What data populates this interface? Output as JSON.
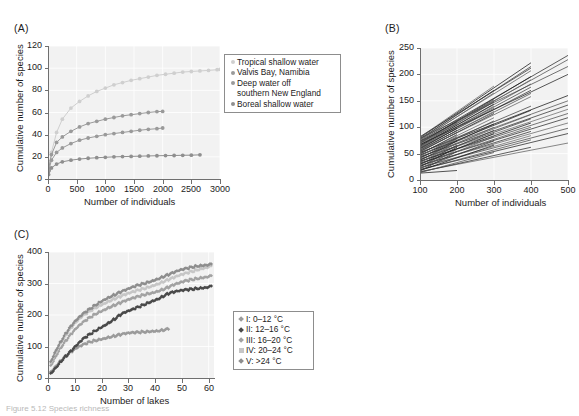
{
  "figure": {
    "caption_fragment": "Figure 5.12  Species richness",
    "panels": [
      "(A)",
      "(B)",
      "(C)"
    ]
  },
  "chart_data": [
    {
      "panel": "(A)",
      "type": "line",
      "title": "",
      "xlabel": "Number of individuals",
      "ylabel": "Cumulative number of species",
      "xlim": [
        0,
        3000
      ],
      "ylim": [
        0,
        120
      ],
      "xticks": [
        0,
        500,
        1000,
        1500,
        2000,
        2500,
        3000
      ],
      "yticks": [
        0,
        20,
        40,
        60,
        80,
        100,
        120
      ],
      "grid": true,
      "legend_position": "right",
      "marker": "circle",
      "series": [
        {
          "name": "Tropical shallow water",
          "color": "#cfcfcf",
          "x": [
            10,
            60,
            150,
            250,
            400,
            550,
            700,
            850,
            1000,
            1150,
            1300,
            1450,
            1600,
            1750,
            1900,
            2050,
            2200,
            2350,
            2500,
            2650,
            2800,
            2950,
            3000
          ],
          "y": [
            8,
            24,
            42,
            54,
            64,
            70,
            75,
            79,
            82,
            85,
            87,
            89,
            90.5,
            92,
            93.5,
            94.5,
            95.5,
            96.5,
            97,
            97.5,
            98,
            98.6,
            99
          ]
        },
        {
          "name": "Valvis Bay, Namibia",
          "color": "#9a9a9a",
          "x": [
            10,
            60,
            150,
            250,
            400,
            550,
            700,
            850,
            1000,
            1150,
            1300,
            1450,
            1600,
            1750,
            1900,
            2000
          ],
          "y": [
            9,
            22,
            33,
            38,
            43,
            47,
            50,
            52,
            54,
            55.5,
            57,
            58,
            59,
            60,
            60.8,
            61
          ]
        },
        {
          "name": "Deep water off southern New England",
          "color": "#9a9a9a",
          "x": [
            10,
            60,
            150,
            250,
            400,
            550,
            700,
            850,
            1000,
            1150,
            1300,
            1450,
            1600,
            1750,
            1900,
            2000
          ],
          "y": [
            7,
            17,
            24,
            28,
            32,
            35,
            37,
            38.5,
            40,
            41,
            42,
            43,
            44,
            44.8,
            45.4,
            46
          ]
        },
        {
          "name": "Boreal shallow water",
          "color": "#8f8f8f",
          "x": [
            10,
            60,
            150,
            250,
            400,
            550,
            700,
            850,
            1000,
            1150,
            1300,
            1450,
            1600,
            1750,
            1900,
            2050,
            2200,
            2350,
            2500,
            2650
          ],
          "y": [
            4,
            10,
            13.5,
            15.5,
            17,
            18,
            18.7,
            19.2,
            19.6,
            20,
            20.2,
            20.4,
            20.6,
            20.8,
            21,
            21.1,
            21.2,
            21.4,
            21.5,
            21.8
          ]
        }
      ],
      "legend": [
        {
          "label": "Tropical shallow water",
          "marker": "circle",
          "color": "#cfcfcf"
        },
        {
          "label": "Valvis Bay, Namibia",
          "marker": "circle",
          "color": "#9a9a9a"
        },
        {
          "label": "Deep water off",
          "label2": "southern New England",
          "marker": "circle",
          "color": "#9a9a9a"
        },
        {
          "label": "Boreal shallow water",
          "marker": "circle",
          "color": "#8f8f8f"
        }
      ]
    },
    {
      "panel": "(B)",
      "type": "line",
      "title": "",
      "xlabel": "Number of individuals",
      "ylabel": "Cumulative number of species",
      "xlim": [
        100,
        500
      ],
      "ylim": [
        0,
        250
      ],
      "xticks": [
        100,
        200,
        300,
        400,
        500
      ],
      "yticks": [
        0,
        50,
        100,
        150,
        200,
        250
      ],
      "grid": true,
      "legend_position": "none",
      "description": "Rarefaction lines fanning from x=100, each terminating at 200, 300, 400 or 500 individuals",
      "lines": [
        {
          "x0": 100,
          "y0": 80,
          "x1": 400,
          "y1": 222
        },
        {
          "x0": 100,
          "y0": 78,
          "x1": 400,
          "y1": 215
        },
        {
          "x0": 100,
          "y0": 76,
          "x1": 400,
          "y1": 207
        },
        {
          "x0": 100,
          "y0": 74,
          "x1": 500,
          "y1": 236
        },
        {
          "x0": 100,
          "y0": 72,
          "x1": 500,
          "y1": 228
        },
        {
          "x0": 100,
          "y0": 70,
          "x1": 400,
          "y1": 196
        },
        {
          "x0": 100,
          "y0": 69,
          "x1": 300,
          "y1": 152
        },
        {
          "x0": 100,
          "y0": 68,
          "x1": 400,
          "y1": 190
        },
        {
          "x0": 100,
          "y0": 66,
          "x1": 300,
          "y1": 148
        },
        {
          "x0": 100,
          "y0": 65,
          "x1": 400,
          "y1": 182
        },
        {
          "x0": 100,
          "y0": 64,
          "x1": 300,
          "y1": 144
        },
        {
          "x0": 100,
          "y0": 63,
          "x1": 400,
          "y1": 176
        },
        {
          "x0": 100,
          "y0": 62,
          "x1": 300,
          "y1": 140
        },
        {
          "x0": 100,
          "y0": 61,
          "x1": 400,
          "y1": 170
        },
        {
          "x0": 100,
          "y0": 60,
          "x1": 300,
          "y1": 136
        },
        {
          "x0": 100,
          "y0": 59,
          "x1": 200,
          "y1": 98
        },
        {
          "x0": 100,
          "y0": 58,
          "x1": 400,
          "y1": 164
        },
        {
          "x0": 100,
          "y0": 57,
          "x1": 300,
          "y1": 130
        },
        {
          "x0": 100,
          "y0": 56,
          "x1": 200,
          "y1": 94
        },
        {
          "x0": 100,
          "y0": 55,
          "x1": 400,
          "y1": 158
        },
        {
          "x0": 100,
          "y0": 54,
          "x1": 300,
          "y1": 126
        },
        {
          "x0": 100,
          "y0": 53,
          "x1": 200,
          "y1": 90
        },
        {
          "x0": 100,
          "y0": 52,
          "x1": 500,
          "y1": 160
        },
        {
          "x0": 100,
          "y0": 51,
          "x1": 400,
          "y1": 140
        },
        {
          "x0": 100,
          "y0": 50,
          "x1": 300,
          "y1": 118
        },
        {
          "x0": 100,
          "y0": 49,
          "x1": 200,
          "y1": 86
        },
        {
          "x0": 100,
          "y0": 48,
          "x1": 500,
          "y1": 150
        },
        {
          "x0": 100,
          "y0": 47,
          "x1": 400,
          "y1": 132
        },
        {
          "x0": 100,
          "y0": 46,
          "x1": 300,
          "y1": 112
        },
        {
          "x0": 100,
          "y0": 45,
          "x1": 200,
          "y1": 82
        },
        {
          "x0": 100,
          "y0": 44,
          "x1": 500,
          "y1": 142
        },
        {
          "x0": 100,
          "y0": 43,
          "x1": 400,
          "y1": 124
        },
        {
          "x0": 100,
          "y0": 42,
          "x1": 300,
          "y1": 106
        },
        {
          "x0": 100,
          "y0": 41,
          "x1": 200,
          "y1": 78
        },
        {
          "x0": 100,
          "y0": 40,
          "x1": 500,
          "y1": 134
        },
        {
          "x0": 100,
          "y0": 39,
          "x1": 400,
          "y1": 116
        },
        {
          "x0": 100,
          "y0": 38,
          "x1": 300,
          "y1": 100
        },
        {
          "x0": 100,
          "y0": 37,
          "x1": 200,
          "y1": 74
        },
        {
          "x0": 100,
          "y0": 36,
          "x1": 500,
          "y1": 126
        },
        {
          "x0": 100,
          "y0": 35,
          "x1": 400,
          "y1": 108
        },
        {
          "x0": 100,
          "y0": 34,
          "x1": 300,
          "y1": 94
        },
        {
          "x0": 100,
          "y0": 33,
          "x1": 200,
          "y1": 70
        },
        {
          "x0": 100,
          "y0": 32,
          "x1": 500,
          "y1": 118
        },
        {
          "x0": 100,
          "y0": 31,
          "x1": 400,
          "y1": 100
        },
        {
          "x0": 100,
          "y0": 30,
          "x1": 300,
          "y1": 88
        },
        {
          "x0": 100,
          "y0": 29,
          "x1": 200,
          "y1": 66
        },
        {
          "x0": 100,
          "y0": 28,
          "x1": 500,
          "y1": 108
        },
        {
          "x0": 100,
          "y0": 27,
          "x1": 400,
          "y1": 92
        },
        {
          "x0": 100,
          "y0": 26,
          "x1": 300,
          "y1": 82
        },
        {
          "x0": 100,
          "y0": 25,
          "x1": 200,
          "y1": 62
        },
        {
          "x0": 100,
          "y0": 24,
          "x1": 500,
          "y1": 98
        },
        {
          "x0": 100,
          "y0": 23,
          "x1": 400,
          "y1": 84
        },
        {
          "x0": 100,
          "y0": 22,
          "x1": 300,
          "y1": 74
        },
        {
          "x0": 100,
          "y0": 21,
          "x1": 200,
          "y1": 58
        },
        {
          "x0": 100,
          "y0": 20,
          "x1": 500,
          "y1": 88
        },
        {
          "x0": 100,
          "y0": 19,
          "x1": 400,
          "y1": 76
        },
        {
          "x0": 100,
          "y0": 18,
          "x1": 300,
          "y1": 66
        },
        {
          "x0": 100,
          "y0": 17,
          "x1": 200,
          "y1": 54
        },
        {
          "x0": 100,
          "y0": 16,
          "x1": 500,
          "y1": 70
        },
        {
          "x0": 100,
          "y0": 15,
          "x1": 400,
          "y1": 62
        },
        {
          "x0": 100,
          "y0": 14,
          "x1": 300,
          "y1": 52
        },
        {
          "x0": 100,
          "y0": 13,
          "x1": 200,
          "y1": 18
        },
        {
          "x0": 100,
          "y0": 77,
          "x1": 300,
          "y1": 170
        },
        {
          "x0": 100,
          "y0": 75,
          "x1": 300,
          "y1": 165
        },
        {
          "x0": 100,
          "y0": 73,
          "x1": 200,
          "y1": 110
        },
        {
          "x0": 100,
          "y0": 71,
          "x1": 200,
          "y1": 106
        },
        {
          "x0": 100,
          "y0": 67,
          "x1": 500,
          "y1": 200
        },
        {
          "x0": 100,
          "y0": 79,
          "x1": 500,
          "y1": 215
        },
        {
          "x0": 100,
          "y0": 81,
          "x1": 300,
          "y1": 178
        },
        {
          "x0": 100,
          "y0": 82,
          "x1": 400,
          "y1": 212
        }
      ]
    },
    {
      "panel": "(C)",
      "type": "line",
      "title": "",
      "xlabel": "Number of lakes",
      "ylabel": "Cumulative number of species",
      "xlim": [
        0,
        62
      ],
      "ylim": [
        0,
        400
      ],
      "xticks": [
        0,
        10,
        20,
        30,
        40,
        50,
        60
      ],
      "yticks": [
        0,
        100,
        200,
        300,
        400
      ],
      "grid": true,
      "legend_position": "right",
      "marker": "diamond",
      "series": [
        {
          "name": "I: 0–12 °C",
          "color": "#9b9b9b",
          "x": [
            1,
            3,
            5,
            7,
            9,
            11,
            13,
            15,
            17,
            19,
            21,
            23,
            25,
            27,
            29,
            31,
            33,
            35,
            37,
            39,
            41,
            43,
            45
          ],
          "y": [
            20,
            40,
            58,
            72,
            84,
            95,
            104,
            112,
            118,
            123,
            127,
            131,
            134,
            137,
            140,
            142,
            144,
            146,
            148,
            150,
            151,
            153,
            155
          ]
        },
        {
          "name": "II: 12–16 °C",
          "color": "#4a4a4a",
          "x": [
            1,
            3,
            5,
            7,
            9,
            11,
            13,
            15,
            17,
            19,
            21,
            23,
            25,
            27,
            29,
            31,
            33,
            35,
            37,
            39,
            41,
            43,
            45,
            47,
            49,
            51,
            53,
            55,
            57,
            59,
            61
          ],
          "y": [
            15,
            35,
            55,
            72,
            88,
            105,
            122,
            135,
            147,
            158,
            168,
            178,
            188,
            200,
            208,
            214,
            222,
            230,
            238,
            246,
            252,
            260,
            268,
            272,
            275,
            278,
            281,
            284,
            287,
            289,
            292
          ]
        },
        {
          "name": "III: 16–20 °C",
          "color": "#a2a2a2",
          "x": [
            1,
            3,
            5,
            7,
            9,
            11,
            13,
            15,
            17,
            19,
            21,
            23,
            25,
            27,
            29,
            31,
            33,
            35,
            37,
            39,
            41,
            43,
            45,
            47,
            49,
            51,
            53,
            55,
            57,
            59,
            61
          ],
          "y": [
            40,
            72,
            100,
            122,
            142,
            160,
            175,
            188,
            200,
            210,
            218,
            226,
            232,
            238,
            244,
            250,
            256,
            262,
            268,
            272,
            277,
            282,
            288,
            295,
            300,
            306,
            311,
            315,
            319,
            322,
            325
          ]
        },
        {
          "name": "IV: 20–24 °C",
          "color": "#c6c6c6",
          "x": [
            1,
            3,
            5,
            7,
            9,
            11,
            13,
            15,
            17,
            19,
            21,
            23,
            25,
            27,
            29,
            31,
            33,
            35,
            37,
            39,
            41,
            43,
            45,
            47,
            49,
            51,
            53,
            55,
            57,
            59,
            61
          ],
          "y": [
            48,
            85,
            115,
            140,
            162,
            180,
            196,
            208,
            220,
            230,
            238,
            246,
            252,
            258,
            264,
            270,
            276,
            282,
            288,
            294,
            300,
            306,
            312,
            318,
            324,
            330,
            336,
            342,
            348,
            352,
            356
          ]
        },
        {
          "name": "V: >24 °C",
          "color": "#8e8e8e",
          "x": [
            1,
            3,
            5,
            7,
            9,
            11,
            13,
            15,
            17,
            19,
            21,
            23,
            25,
            27,
            29,
            31,
            33,
            35,
            37,
            39,
            41,
            43,
            45,
            47,
            49,
            51,
            53,
            55,
            57,
            59,
            61
          ],
          "y": [
            52,
            90,
            120,
            146,
            168,
            186,
            202,
            215,
            228,
            240,
            250,
            258,
            265,
            272,
            278,
            285,
            292,
            298,
            304,
            310,
            316,
            322,
            328,
            334,
            340,
            345,
            350,
            355,
            358,
            360,
            362
          ]
        }
      ],
      "legend": [
        {
          "label": "I: 0–12 °C",
          "marker": "diamond",
          "color": "#9b9b9b"
        },
        {
          "label": "II: 12–16 °C",
          "marker": "diamond",
          "color": "#4a4a4a"
        },
        {
          "label": "III: 16–20 °C",
          "marker": "diamond",
          "color": "#a2a2a2"
        },
        {
          "label": "IV: 20–24 °C",
          "marker": "square",
          "color": "#c6c6c6"
        },
        {
          "label": "V: >24 °C",
          "marker": "diamond",
          "color": "#8e8e8e"
        }
      ]
    }
  ]
}
